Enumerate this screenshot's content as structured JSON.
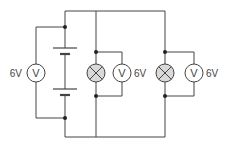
{
  "diagram": {
    "type": "circuit",
    "colors": {
      "wire": "#444444",
      "lamp_fill": "#d9d9d9",
      "background": "#ffffff"
    },
    "battery": {
      "cells": 2
    },
    "voltmeters": [
      {
        "id": "battery-voltmeter",
        "symbol": "V",
        "reading": "6V"
      },
      {
        "id": "lamp1-voltmeter",
        "symbol": "V",
        "reading": "6V"
      },
      {
        "id": "lamp2-voltmeter",
        "symbol": "V",
        "reading": "6V"
      }
    ],
    "lamps": [
      {
        "id": "lamp1"
      },
      {
        "id": "lamp2"
      }
    ]
  }
}
